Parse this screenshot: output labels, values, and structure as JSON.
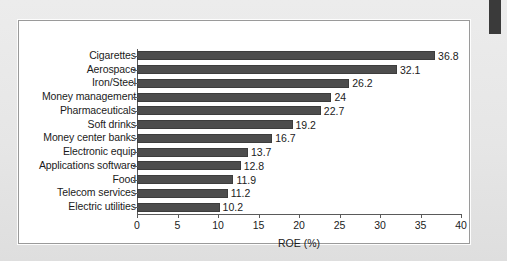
{
  "figure": {
    "background_color": "#ffffff",
    "page_color": "#e9e9e9",
    "bar_color": "#4d4d4d",
    "axis_color": "#5a5a5a",
    "edge_marker_color": "#3a3a3a"
  },
  "chart_data": {
    "type": "bar",
    "orientation": "horizontal",
    "title": "",
    "xlabel": "ROE (%)",
    "ylabel": "",
    "xlim": [
      0,
      40
    ],
    "xticks": [
      0,
      5,
      10,
      15,
      20,
      25,
      30,
      35,
      40
    ],
    "xtick_labels": [
      "0",
      "5",
      "10",
      "15",
      "20",
      "25",
      "30",
      "35",
      "40"
    ],
    "grid": false,
    "legend": false,
    "categories": [
      "Cigarettes",
      "Aerospace",
      "Iron/Steel",
      "Money management",
      "Pharmaceuticals",
      "Soft drinks",
      "Money center banks",
      "Electronic equip",
      "Applications software",
      "Food",
      "Telecom services",
      "Electric utilities"
    ],
    "values": [
      36.8,
      32.1,
      26.2,
      24,
      22.7,
      19.2,
      16.7,
      13.7,
      12.8,
      11.9,
      11.2,
      10.2
    ],
    "value_labels": [
      "36.8",
      "32.1",
      "26.2",
      "24",
      "22.7",
      "19.2",
      "16.7",
      "13.7",
      "12.8",
      "11.9",
      "11.2",
      "10.2"
    ]
  }
}
